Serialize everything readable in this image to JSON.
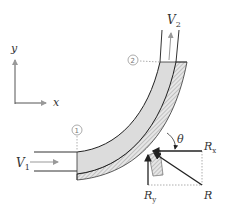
{
  "diagram": {
    "type": "pipe-bend-force-diagram",
    "axes": {
      "x_label": "x",
      "y_label": "y"
    },
    "velocities": {
      "inlet": {
        "symbol": "V",
        "subscript": "1"
      },
      "outlet": {
        "symbol": "V",
        "subscript": "2"
      }
    },
    "sections": {
      "inlet": "①",
      "outlet": "②"
    },
    "forces": {
      "rx": {
        "symbol": "R",
        "subscript": "x"
      },
      "ry": {
        "symbol": "R",
        "subscript": "y"
      },
      "r": {
        "symbol": "R"
      }
    },
    "angle": "θ",
    "colors": {
      "fluid_fill": "#dcdcdc",
      "wall_hatch": "#999999",
      "line": "#222222",
      "arrow_gray": "#999999",
      "dashed": "#999999"
    }
  }
}
